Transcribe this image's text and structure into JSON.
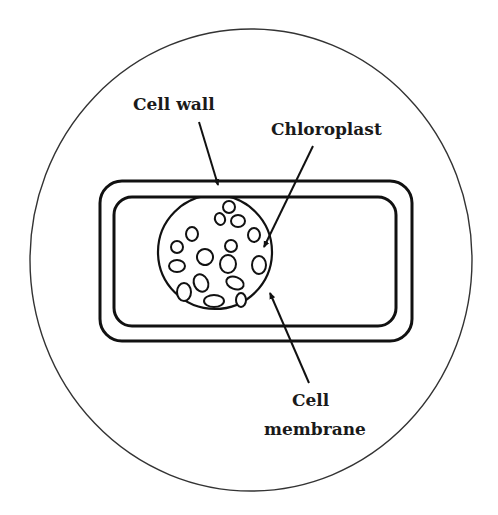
{
  "diagram": {
    "type": "biology-cell-diagram",
    "colors": {
      "line": "#111111",
      "background": "#ffffff",
      "text": "#1a1a1a"
    },
    "field_of_view": {
      "cx": 251,
      "cy": 260,
      "rx": 221,
      "ry": 231
    },
    "cell_wall": {
      "x": 100,
      "y": 181,
      "w": 312,
      "h": 160,
      "r": 22
    },
    "cell_membrane": {
      "x": 114,
      "y": 197,
      "w": 282,
      "h": 129,
      "r": 18
    },
    "nucleus_region": {
      "cx": 215,
      "cy": 252,
      "rx": 57,
      "ry": 57
    },
    "chloroplasts": [
      {
        "cx": 229,
        "cy": 207,
        "rx": 6,
        "ry": 6,
        "rot": 0
      },
      {
        "cx": 220,
        "cy": 219,
        "rx": 5,
        "ry": 6,
        "rot": -20
      },
      {
        "cx": 238,
        "cy": 221,
        "rx": 7,
        "ry": 6,
        "rot": 0
      },
      {
        "cx": 192,
        "cy": 234,
        "rx": 6,
        "ry": 7,
        "rot": 0
      },
      {
        "cx": 254,
        "cy": 235,
        "rx": 6,
        "ry": 7,
        "rot": 0
      },
      {
        "cx": 177,
        "cy": 247,
        "rx": 6,
        "ry": 6,
        "rot": 0
      },
      {
        "cx": 205,
        "cy": 257,
        "rx": 8,
        "ry": 8,
        "rot": 20
      },
      {
        "cx": 231,
        "cy": 246,
        "rx": 6,
        "ry": 6,
        "rot": 0
      },
      {
        "cx": 228,
        "cy": 264,
        "rx": 8,
        "ry": 9,
        "rot": 0
      },
      {
        "cx": 259,
        "cy": 265,
        "rx": 7,
        "ry": 9,
        "rot": 0
      },
      {
        "cx": 177,
        "cy": 266,
        "rx": 8,
        "ry": 6,
        "rot": 0
      },
      {
        "cx": 201,
        "cy": 283,
        "rx": 7,
        "ry": 9,
        "rot": -25
      },
      {
        "cx": 235,
        "cy": 283,
        "rx": 9,
        "ry": 6,
        "rot": 20
      },
      {
        "cx": 184,
        "cy": 292,
        "rx": 7,
        "ry": 9,
        "rot": 0
      },
      {
        "cx": 214,
        "cy": 301,
        "rx": 10,
        "ry": 6,
        "rot": 0
      },
      {
        "cx": 241,
        "cy": 300,
        "rx": 5,
        "ry": 7,
        "rot": 0
      }
    ],
    "labels": [
      {
        "id": "cell-wall",
        "text": "Cell wall",
        "x": 133,
        "y": 96
      },
      {
        "id": "chloroplast",
        "text": "Chloroplast",
        "x": 271,
        "y": 121
      },
      {
        "id": "cell-membrane-line1",
        "text": "Cell",
        "x": 292,
        "y": 392
      },
      {
        "id": "cell-membrane-line2",
        "text": "membrane",
        "x": 264,
        "y": 421
      }
    ],
    "pointers": [
      {
        "id": "cell-wall-arrow",
        "x1": 199,
        "y1": 122,
        "x2": 218,
        "y2": 185
      },
      {
        "id": "chloroplast-arrow",
        "x1": 313,
        "y1": 146,
        "x2": 264,
        "y2": 247
      },
      {
        "id": "cell-membrane-arrow",
        "x1": 309,
        "y1": 383,
        "x2": 270,
        "y2": 293
      }
    ]
  }
}
